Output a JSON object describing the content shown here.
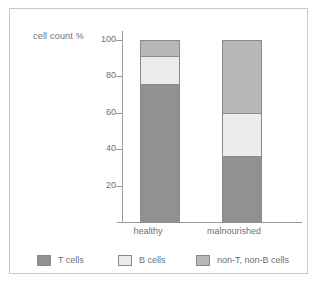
{
  "chart_data": {
    "type": "bar",
    "stacked": true,
    "title": "",
    "xlabel": "",
    "ylabel": "cell count %",
    "categories": [
      "healthy",
      "malnourished"
    ],
    "ylim": [
      0,
      100
    ],
    "yticks": [
      20,
      40,
      60,
      80,
      100
    ],
    "ytick_labels": [
      "20",
      "40",
      "60",
      "80",
      "100"
    ],
    "grid": false,
    "legend_position": "bottom",
    "series": [
      {
        "name": "T cells",
        "color": "#919191",
        "values": [
          76,
          36
        ]
      },
      {
        "name": "B cells",
        "color": "#ececec",
        "values": [
          15,
          24
        ]
      },
      {
        "name": "non-T, non-B cells",
        "color": "#b8b8b8",
        "values": [
          9,
          40
        ]
      }
    ]
  },
  "axis": {
    "y_label": "cell count %",
    "ticks": [
      "100",
      "80",
      "60",
      "40",
      "20"
    ],
    "category_labels": [
      "healthy",
      "malnourished"
    ]
  },
  "legend": {
    "items": [
      {
        "label": "T cells",
        "color": "#919191"
      },
      {
        "label": "B cells",
        "color": "#ececec"
      },
      {
        "label": "non-T, non-B cells",
        "color": "#b8b8b8"
      }
    ]
  },
  "colors": {
    "frame_border": "#c9c9c9",
    "axis": "#9a9a9a",
    "text": "#6f6f6f",
    "bar_outline": "#8a8a8a",
    "background": "#ffffff"
  }
}
